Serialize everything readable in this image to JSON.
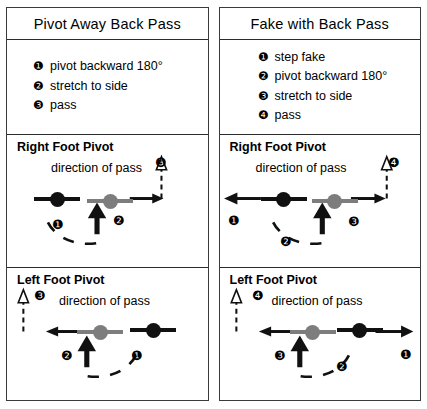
{
  "left_panel": {
    "title": "Pivot Away Back Pass",
    "steps": [
      {
        "badge": "❶",
        "text": "pivot backward 180°"
      },
      {
        "badge": "❷",
        "text": "stretch to side"
      },
      {
        "badge": "❸",
        "text": "pass"
      }
    ],
    "sections": [
      {
        "title": "Right Foot Pivot",
        "direction_label": "direction of pass",
        "pass_badge": "❸",
        "step_badges": [
          "❶",
          "❷"
        ]
      },
      {
        "title": "Left Foot Pivot",
        "direction_label": "direction of pass",
        "pass_badge": "❸",
        "step_badges": [
          "❷",
          "❶"
        ]
      }
    ]
  },
  "right_panel": {
    "title": "Fake with Back Pass",
    "steps": [
      {
        "badge": "❶",
        "text": "step fake"
      },
      {
        "badge": "❷",
        "text": "pivot backward 180°"
      },
      {
        "badge": "❸",
        "text": "stretch to side"
      },
      {
        "badge": "❹",
        "text": "pass"
      }
    ],
    "sections": [
      {
        "title": "Right Foot Pivot",
        "direction_label": "direction of pass",
        "pass_badge": "❹",
        "step_badges": [
          "❶",
          "❷",
          "❸"
        ]
      },
      {
        "title": "Left Foot Pivot",
        "direction_label": "direction of pass",
        "pass_badge": "❹",
        "step_badges": [
          "❸",
          "❷",
          "❶"
        ]
      }
    ]
  },
  "colors": {
    "pivot_foot": "#111111",
    "moving_foot": "#7d7d7d",
    "border": "#3a3a3a"
  }
}
